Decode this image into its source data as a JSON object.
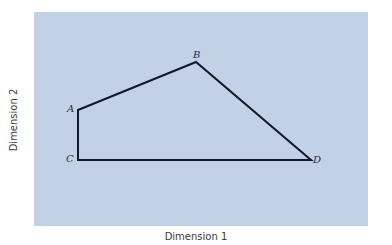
{
  "diagram": {
    "background_color": "#c3d1e6",
    "line_color": "#111827",
    "xlabel": "Dimension 1",
    "ylabel": "Dimension 2",
    "points": [
      {
        "label": "A",
        "x": 78,
        "y": 110
      },
      {
        "label": "B",
        "x": 196,
        "y": 62
      },
      {
        "label": "D",
        "x": 311,
        "y": 160
      },
      {
        "label": "C",
        "x": 78,
        "y": 160
      }
    ],
    "path_order": [
      "A",
      "B",
      "D",
      "C",
      "A"
    ]
  }
}
